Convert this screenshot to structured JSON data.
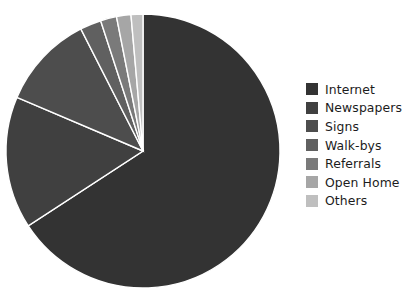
{
  "chart_data": {
    "type": "pie",
    "title": "",
    "categories": [
      "Internet",
      "Newspapers",
      "Signs",
      "Walk-bys",
      "Referrals",
      "Open Home",
      "Others"
    ],
    "values": [
      65.8,
      15.6,
      11.1,
      2.5,
      1.9,
      1.7,
      1.4
    ],
    "units": "percent",
    "start_angle_deg": 0,
    "direction": "clockwise",
    "legend_position": "right",
    "grid": false,
    "colors": [
      "#333333",
      "#404040",
      "#4d4d4d",
      "#606060",
      "#7a7a7a",
      "#a6a6a6",
      "#bfbfbf"
    ]
  },
  "pie": {
    "center_x": 143,
    "center_y": 151,
    "radius": 137,
    "separator_color": "#ffffff",
    "separator_width": 1.4,
    "background": "#ffffff"
  },
  "legend": {
    "items": [
      {
        "label": "Internet",
        "color": "#333333"
      },
      {
        "label": "Newspapers",
        "color": "#404040"
      },
      {
        "label": "Signs",
        "color": "#4d4d4d"
      },
      {
        "label": "Walk-bys",
        "color": "#606060"
      },
      {
        "label": "Referrals",
        "color": "#7a7a7a"
      },
      {
        "label": "Open Home",
        "color": "#a6a6a6"
      },
      {
        "label": "Others",
        "color": "#bfbfbf"
      }
    ]
  }
}
